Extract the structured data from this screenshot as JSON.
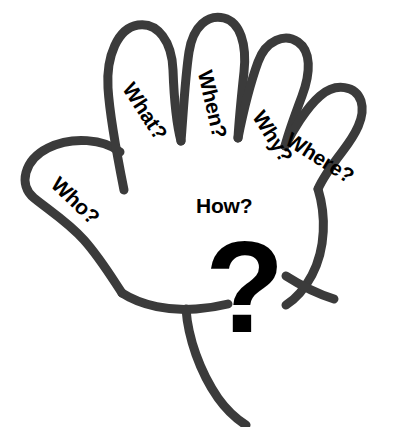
{
  "figure": {
    "background_color": "#ffffff",
    "outline_color": "#3b3b3b",
    "ink_color": "#000000",
    "stroke_width": 9
  },
  "labels": {
    "who": {
      "text": "Who?",
      "rotation_deg": 44,
      "x": 55,
      "y": 170,
      "font_size": 21
    },
    "what": {
      "text": "What?",
      "rotation_deg": 57,
      "x": 128,
      "y": 74,
      "font_size": 21
    },
    "when": {
      "text": "When?",
      "rotation_deg": 77,
      "x": 205,
      "y": 60,
      "font_size": 21
    },
    "why": {
      "text": "Why?",
      "rotation_deg": 58,
      "x": 258,
      "y": 102,
      "font_size": 21
    },
    "where": {
      "text": "Where?",
      "rotation_deg": 32,
      "x": 288,
      "y": 127,
      "font_size": 21
    },
    "how": {
      "text": "How?",
      "rotation_deg": 0,
      "x": 196,
      "y": 195,
      "font_size": 21
    }
  },
  "question_mark": {
    "glyph": "?",
    "color": "#000000",
    "x": 205,
    "y": 222,
    "size": 130
  }
}
